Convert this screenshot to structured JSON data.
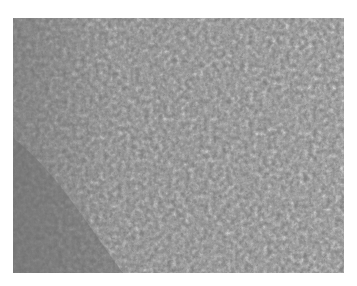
{
  "image": {
    "description": "Grayscale histology micrograph of densely packed cellular tissue",
    "background_color": "#ffffff",
    "tissue_base_color": "#7a7a7a"
  }
}
